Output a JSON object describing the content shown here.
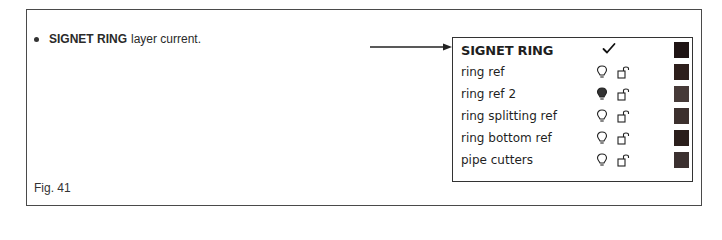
{
  "bullet": {
    "bold": "SIGNET RING",
    "rest": "layer current."
  },
  "figure_label": "Fig. 41",
  "layers_panel": {
    "layers": [
      {
        "name": "SIGNET RING",
        "current": true,
        "status_icon": "checkmark-icon",
        "color": "#1f1414"
      },
      {
        "name": "ring ref",
        "current": false,
        "bulb": "on",
        "lock": "unlocked",
        "color": "#2e1f1c"
      },
      {
        "name": "ring ref 2",
        "current": false,
        "bulb": "off",
        "lock": "unlocked",
        "color": "#463a38"
      },
      {
        "name": "ring splitting ref",
        "current": false,
        "bulb": "on",
        "lock": "unlocked",
        "color": "#3c302e"
      },
      {
        "name": "ring bottom ref",
        "current": false,
        "bulb": "on",
        "lock": "unlocked",
        "color": "#2a1e1b"
      },
      {
        "name": "pipe cutters",
        "current": false,
        "bulb": "on",
        "lock": "unlocked",
        "color": "#3b302f"
      }
    ]
  }
}
